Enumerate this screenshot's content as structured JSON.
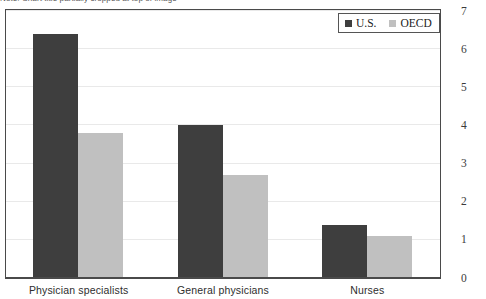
{
  "header": {
    "cut_off_text": "Note: Chart title partially cropped at top of image"
  },
  "legend": {
    "position": "top-right",
    "entries": [
      {
        "label": "U.S.",
        "color": "#3e3e3e",
        "icon": "square-swatch-icon"
      },
      {
        "label": "OECD",
        "color": "#c0c0c0",
        "icon": "square-swatch-icon"
      }
    ]
  },
  "axis": {
    "y_ticks": [
      "0",
      "1",
      "2",
      "3",
      "4",
      "5",
      "6",
      "7"
    ],
    "x_ticks": [
      "Physician specialists",
      "General physicians",
      "Nurses"
    ]
  },
  "chart_data": {
    "type": "bar",
    "title": "",
    "xlabel": "",
    "ylabel": "",
    "ylim": [
      0,
      7
    ],
    "yticks": [
      0,
      1,
      2,
      3,
      4,
      5,
      6,
      7
    ],
    "grid": true,
    "legend_position": "top-right",
    "categories": [
      "Physician specialists",
      "General physicians",
      "Nurses"
    ],
    "series": [
      {
        "name": "U.S.",
        "color": "#3e3e3e",
        "values": [
          6.4,
          4.0,
          1.4
        ]
      },
      {
        "name": "OECD",
        "color": "#c0c0c0",
        "values": [
          3.8,
          2.7,
          1.1
        ]
      }
    ]
  },
  "colors": {
    "us": "#3e3e3e",
    "oecd": "#c0c0c0",
    "border": "#4a4a4a",
    "gridline": "#e9e9e9",
    "background": "#ffffff"
  }
}
